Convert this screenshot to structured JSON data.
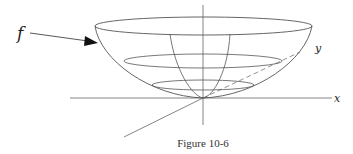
{
  "figure": {
    "caption": "Figure 10-6",
    "labels": {
      "function": "f",
      "x_axis": "x",
      "y_axis": "y"
    }
  },
  "colors": {
    "line": "#555555",
    "text": "#222222",
    "background": "#ffffff"
  }
}
